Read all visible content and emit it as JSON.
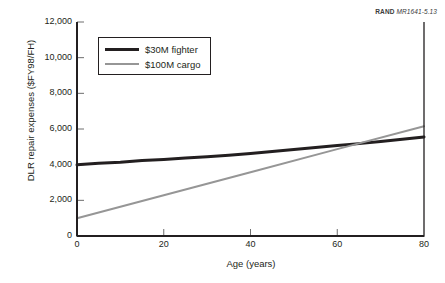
{
  "source_credit": {
    "publisher": "RAND",
    "figure_number": "MR1641-5.13"
  },
  "chart_data": {
    "type": "line",
    "title": "",
    "xlabel": "Age (years)",
    "ylabel": "DLR repair expenses ($FY98/FH)",
    "xlim": [
      0,
      80
    ],
    "ylim": [
      0,
      12000
    ],
    "xticks": [
      0,
      20,
      40,
      60,
      80
    ],
    "xtick_labels": [
      "0",
      "20",
      "40",
      "60",
      "80"
    ],
    "yticks": [
      0,
      2000,
      4000,
      6000,
      8000,
      10000,
      12000
    ],
    "ytick_labels": [
      "0",
      "2,000",
      "4,000",
      "6,000",
      "8,000",
      "10,000",
      "12,000"
    ],
    "grid": false,
    "legend_position": "upper-left",
    "series": [
      {
        "name": "$30M fighter",
        "color": "#231f20",
        "line_width": 3,
        "x": [
          0,
          5,
          10,
          15,
          20,
          25,
          30,
          35,
          40,
          45,
          50,
          55,
          60,
          65,
          70,
          75,
          80
        ],
        "values": [
          3990,
          4080,
          4140,
          4230,
          4290,
          4370,
          4450,
          4530,
          4630,
          4740,
          4850,
          4960,
          5070,
          5180,
          5300,
          5420,
          5550
        ]
      },
      {
        "name": "$100M cargo",
        "color": "#969696",
        "line_width": 2,
        "x": [
          0,
          20,
          40,
          60,
          80
        ],
        "values": [
          1000,
          2290,
          3580,
          4870,
          6150
        ]
      }
    ],
    "annotations": [
      {
        "text": "crossover",
        "x": 66,
        "y": 5250
      }
    ]
  }
}
